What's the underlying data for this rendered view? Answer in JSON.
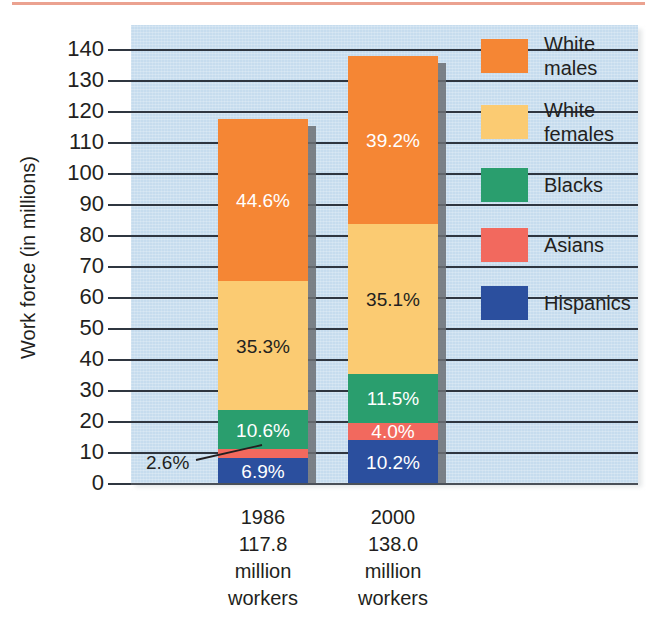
{
  "figure": {
    "top_rule_color": "#e8927c",
    "panel_color": "#c6dcee",
    "y_axis_title": "Work force (in millions)"
  },
  "chart_data": {
    "type": "bar",
    "subtype": "stacked-vertical",
    "title": "",
    "xlabel": "",
    "ylabel": "Work force (in millions)",
    "ylim": [
      0,
      145
    ],
    "ytick_values": [
      0,
      10,
      20,
      30,
      40,
      50,
      60,
      70,
      80,
      90,
      100,
      110,
      120,
      130,
      140
    ],
    "ytick_labels": [
      "0",
      "10",
      "20",
      "30",
      "40",
      "50",
      "60",
      "70",
      "80",
      "90",
      "100",
      "110",
      "120",
      "130",
      "140"
    ],
    "grid": true,
    "legend_position": "right",
    "categories": [
      "1986",
      "2000"
    ],
    "category_totals": [
      117.8,
      138.0
    ],
    "category_caption_lines": [
      [
        "1986",
        "117.8",
        "million",
        "workers"
      ],
      [
        "2000",
        "138.0",
        "million",
        "workers"
      ]
    ],
    "stack_order_bottom_to_top": [
      "Hispanics",
      "Asians",
      "Blacks",
      "White females",
      "White males"
    ],
    "series": [
      {
        "name": "Hispanics",
        "color": "#2b4f9e",
        "label_color": "light",
        "percent_labels": [
          "6.9%",
          "10.2%"
        ],
        "percents": [
          6.9,
          10.2
        ],
        "values": [
          8.13,
          14.08
        ]
      },
      {
        "name": "Asians",
        "color": "#f2695e",
        "label_color": "light",
        "percent_labels": [
          "2.6%",
          "4.0%"
        ],
        "percents": [
          2.6,
          4.0
        ],
        "values": [
          3.06,
          5.52
        ],
        "label_inside": [
          false,
          true
        ]
      },
      {
        "name": "Blacks",
        "color": "#2a9e6e",
        "label_color": "light",
        "percent_labels": [
          "10.6%",
          "11.5%"
        ],
        "percents": [
          10.6,
          11.5
        ],
        "values": [
          12.49,
          15.87
        ]
      },
      {
        "name": "White females",
        "color": "#fbcb72",
        "label_color": "dark",
        "percent_labels": [
          "35.3%",
          "35.1%"
        ],
        "percents": [
          35.3,
          35.1
        ],
        "values": [
          41.58,
          48.44
        ]
      },
      {
        "name": "White males",
        "color": "#f58634",
        "label_color": "light",
        "percent_labels": [
          "44.6%",
          "39.2%"
        ],
        "percents": [
          44.6,
          39.2
        ],
        "values": [
          52.54,
          54.1
        ]
      }
    ],
    "annotations": [
      {
        "text": "2.6%",
        "refers_to": "Asians 1986",
        "has_leader_line": true
      }
    ]
  },
  "legend": {
    "items": [
      {
        "label": "White\nmales",
        "color": "#f58634"
      },
      {
        "label": "White\nfemales",
        "color": "#fbcb72"
      },
      {
        "label": "Blacks",
        "color": "#2a9e6e"
      },
      {
        "label": "Asians",
        "color": "#f2695e"
      },
      {
        "label": "Hispanics",
        "color": "#2b4f9e"
      }
    ]
  }
}
